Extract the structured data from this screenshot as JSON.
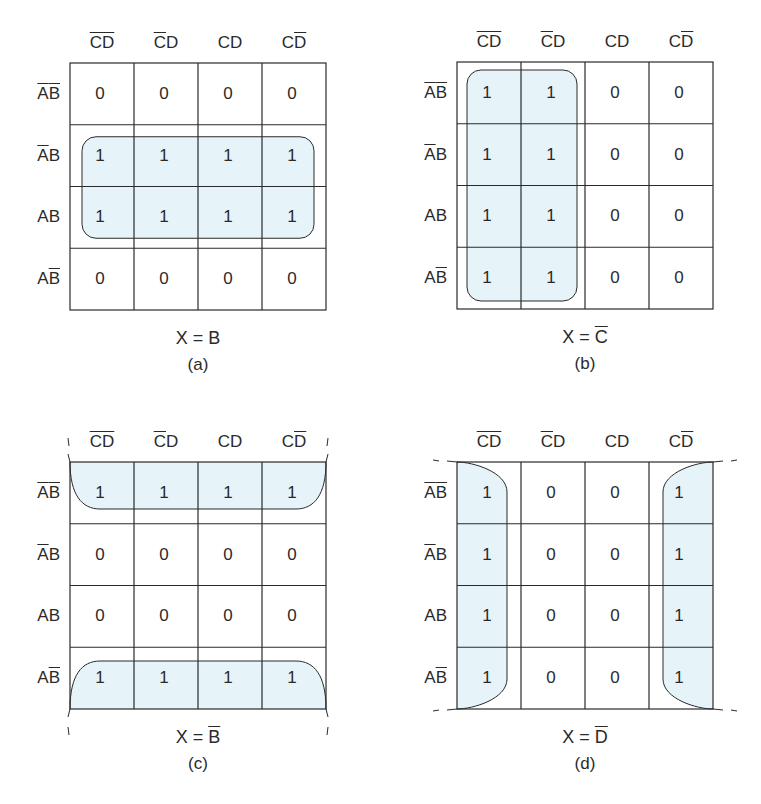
{
  "figure": {
    "fill_color": "#e6f3f8",
    "line_color": "#2a2a2a",
    "column_headers": [
      {
        "parts": [
          {
            "t": "C",
            "bar": true
          },
          {
            "t": "D",
            "bar": true
          }
        ]
      },
      {
        "parts": [
          {
            "t": "C",
            "bar": true
          },
          {
            "t": "D",
            "bar": false
          }
        ]
      },
      {
        "parts": [
          {
            "t": "C",
            "bar": false
          },
          {
            "t": "D",
            "bar": false
          }
        ]
      },
      {
        "parts": [
          {
            "t": "C",
            "bar": false
          },
          {
            "t": "D",
            "bar": true
          }
        ]
      }
    ],
    "row_headers": [
      {
        "parts": [
          {
            "t": "A",
            "bar": true
          },
          {
            "t": "B",
            "bar": true
          }
        ]
      },
      {
        "parts": [
          {
            "t": "A",
            "bar": true
          },
          {
            "t": "B",
            "bar": false
          }
        ]
      },
      {
        "parts": [
          {
            "t": "A",
            "bar": false
          },
          {
            "t": "B",
            "bar": false
          }
        ]
      },
      {
        "parts": [
          {
            "t": "A",
            "bar": false
          },
          {
            "t": "B",
            "bar": true
          }
        ]
      }
    ],
    "maps": [
      {
        "id": "a",
        "origin": [
          70,
          63
        ],
        "cells": [
          [
            0,
            0,
            0,
            0
          ],
          [
            1,
            1,
            1,
            1
          ],
          [
            1,
            1,
            1,
            1
          ],
          [
            0,
            0,
            0,
            0
          ]
        ],
        "grouping": "rows-1-2",
        "equation": {
          "lhs": "X = ",
          "var": "B",
          "bar": false
        },
        "caption": "(a)"
      },
      {
        "id": "b",
        "origin": [
          457,
          62
        ],
        "cells": [
          [
            1,
            1,
            0,
            0
          ],
          [
            1,
            1,
            0,
            0
          ],
          [
            1,
            1,
            0,
            0
          ],
          [
            1,
            1,
            0,
            0
          ]
        ],
        "grouping": "cols-0-1",
        "equation": {
          "lhs": "X = ",
          "var": "C",
          "bar": true
        },
        "caption": "(b)"
      },
      {
        "id": "c",
        "origin": [
          70,
          462
        ],
        "cells": [
          [
            1,
            1,
            1,
            1
          ],
          [
            0,
            0,
            0,
            0
          ],
          [
            0,
            0,
            0,
            0
          ],
          [
            1,
            1,
            1,
            1
          ]
        ],
        "grouping": "wrap-rows-0-3",
        "equation": {
          "lhs": "X = ",
          "var": "B",
          "bar": true
        },
        "caption": "(c)"
      },
      {
        "id": "d",
        "origin": [
          457,
          462
        ],
        "cells": [
          [
            1,
            0,
            0,
            1
          ],
          [
            1,
            0,
            0,
            1
          ],
          [
            1,
            0,
            0,
            1
          ],
          [
            1,
            0,
            0,
            1
          ]
        ],
        "grouping": "wrap-cols-0-3",
        "equation": {
          "lhs": "X = ",
          "var": "D",
          "bar": true
        },
        "caption": "(d)"
      }
    ]
  }
}
